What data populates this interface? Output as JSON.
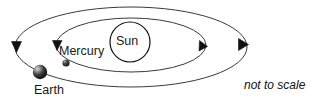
{
  "diagram": {
    "note": "not to scale",
    "labels": {
      "sun": "Sun",
      "mercury": "Mercury",
      "earth": "Earth"
    },
    "colors": {
      "background": "#ffffff",
      "orbit_stroke": "#3a3a3a",
      "sun_stroke": "#111111",
      "text": "#1a1a1a",
      "earth_body_dark": "#111111",
      "earth_body_light": "#c9c9c9",
      "mercury_body": "#1a1a1a"
    },
    "bodies": [
      {
        "name": "sun",
        "label": "Sun",
        "shape": "open-circle",
        "cx": 130,
        "cy": 42,
        "r": 20
      },
      {
        "name": "mercury",
        "label": "Mercury",
        "shape": "filled-sphere",
        "cx": 66,
        "cy": 63,
        "r": 3.6
      },
      {
        "name": "earth",
        "label": "Earth",
        "shape": "shaded-sphere",
        "cx": 40,
        "cy": 72,
        "r": 7.2
      }
    ],
    "orbits": [
      {
        "name": "mercury-orbit",
        "belongs_to": "Mercury",
        "cx": 131,
        "cy": 45,
        "rx": 75,
        "ry": 27,
        "direction": "clockwise",
        "arrow_count": 2
      },
      {
        "name": "earth-orbit",
        "belongs_to": "Earth",
        "cx": 131,
        "cy": 47,
        "rx": 116,
        "ry": 40,
        "direction": "clockwise",
        "arrow_count": 2
      }
    ]
  }
}
